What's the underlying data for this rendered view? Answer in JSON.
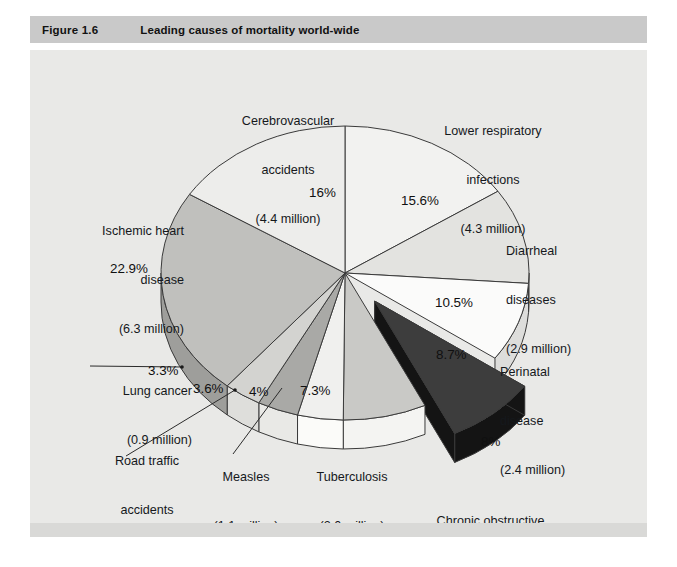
{
  "header": {
    "figure_number": "Figure 1.6",
    "title": "Leading causes of mortality world-wide"
  },
  "colors": {
    "header_bg": "#c9c9c9",
    "canvas_bg": "#e9e9e7",
    "outline": "#3a3a3a",
    "exploded_top": "#3d3d3d",
    "exploded_side": "#151515"
  },
  "chart_data": {
    "type": "pie",
    "title": "Leading causes of mortality world-wide",
    "xlabel": "",
    "ylabel": "",
    "units": "percent of total deaths",
    "legend": "none (direct labels with leader lines)",
    "exploded_slice": "Chronic obstructive pulmonary disease",
    "start_angle_deg": 0,
    "direction": "clockwise",
    "three_d": true,
    "slices": [
      {
        "name": "Lower respiratory infections",
        "label_l1": "Lower respiratory",
        "label_l2": "infections",
        "label_l3": "(4.3 million)",
        "percent": 15.6,
        "percent_text": "15.6%",
        "deaths_millions": 4.3,
        "fill": "#f2f2f0",
        "side_fill": "#d6d6d4"
      },
      {
        "name": "Diarrheal diseases",
        "label_l1": "Diarrheal",
        "label_l2": "diseases",
        "label_l3": "(2.9 million)",
        "percent": 10.5,
        "percent_text": "10.5%",
        "deaths_millions": 2.9,
        "fill": "#e3e3e0",
        "side_fill": "#c2c2bf"
      },
      {
        "name": "Perinatal disease",
        "label_l1": "Perinatal",
        "label_l2": "disease",
        "label_l3": "(2.4 million)",
        "percent": 8.7,
        "percent_text": "8.7%",
        "deaths_millions": 2.4,
        "fill": "#fbfbfa",
        "side_fill": "#dddddb"
      },
      {
        "name": "Chronic obstructive pulmonary disease",
        "label_l1": "Chronic obstructive",
        "label_l2": "pulmonary disease",
        "label_l3": "(2.2 million)",
        "percent": 8,
        "percent_text": "8%",
        "deaths_millions": 2.2,
        "fill": "#3d3d3d",
        "side_fill": "#141414"
      },
      {
        "name": "Tuberculosis",
        "label_l1": "Tuberculosis",
        "label_l2": "(2.0 million)",
        "label_l3": "",
        "percent": 7.3,
        "percent_text": "7.3%",
        "deaths_millions": 2.0,
        "fill": "#c9c9c6",
        "side_fill": "#f4f4f2"
      },
      {
        "name": "Measles",
        "label_l1": "Measles",
        "label_l2": "(1.1 million)",
        "label_l3": "",
        "percent": 4,
        "percent_text": "4%",
        "deaths_millions": 1.1,
        "fill": "#f0f0ee",
        "side_fill": "#fbfbf9"
      },
      {
        "name": "Road traffic accidents",
        "label_l1": "Road traffic",
        "label_l2": "accidents",
        "label_l3": "(1.0 million)",
        "percent": 3.6,
        "percent_text": "3.6%",
        "deaths_millions": 1.0,
        "fill": "#a9a9a6",
        "side_fill": "#e9e9e6"
      },
      {
        "name": "Lung cancer",
        "label_l1": "Lung cancer",
        "label_l2": "(0.9 million)",
        "label_l3": "",
        "percent": 3.3,
        "percent_text": "3.3%",
        "deaths_millions": 0.9,
        "fill": "#d3d3d0",
        "side_fill": "#dededb"
      },
      {
        "name": "Ischemic heart disease",
        "label_l1": "Ischemic heart",
        "label_l2": "disease",
        "label_l3": "(6.3 million)",
        "percent": 22.9,
        "percent_text": "22.9%",
        "deaths_millions": 6.3,
        "fill": "#c0c0bd",
        "side_fill": "#9e9e9b"
      },
      {
        "name": "Cerebrovascular accidents",
        "label_l1": "Cerebrovascular",
        "label_l2": "accidents",
        "label_l3": "(4.4 million)",
        "percent": 16,
        "percent_text": "16%",
        "deaths_millions": 4.4,
        "fill": "#ededeb",
        "side_fill": "#cccccb"
      }
    ]
  }
}
